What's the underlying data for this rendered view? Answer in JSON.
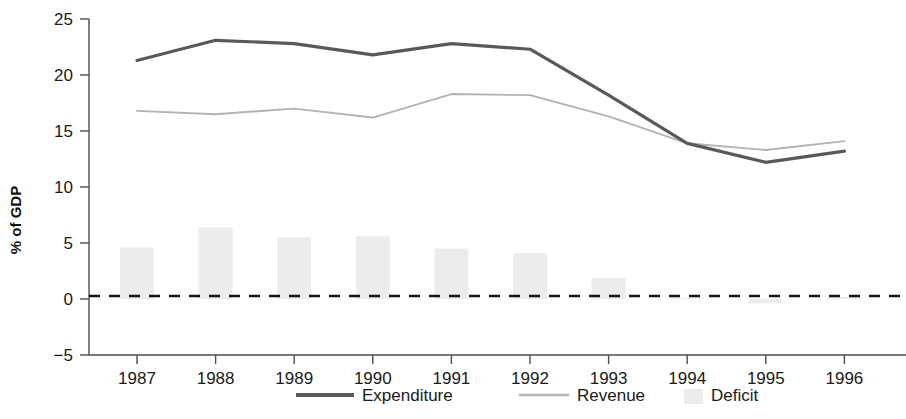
{
  "chart_data": {
    "type": "line",
    "title": "",
    "subtitle": "",
    "xlabel": "",
    "ylabel": "% of GDP",
    "categories": [
      "1987",
      "1988",
      "1989",
      "1990",
      "1991",
      "1992",
      "1993",
      "1994",
      "1995",
      "1996"
    ],
    "x": [
      1987,
      1988,
      1989,
      1990,
      1991,
      1992,
      1993,
      1994,
      1995,
      1996
    ],
    "ylim": [
      -5,
      25
    ],
    "yticks": [
      25,
      20,
      15,
      10,
      5,
      0,
      -5
    ],
    "ytick_labels": [
      "25",
      "20",
      "15",
      "10",
      "5",
      "0",
      "−5"
    ],
    "grid": false,
    "legend_position": "bottom",
    "zero_reference_line": 0,
    "series": [
      {
        "name": "Expenditure",
        "type": "line",
        "color": "#595959",
        "values": [
          21.3,
          23.1,
          22.8,
          21.8,
          22.8,
          22.3,
          18.2,
          13.9,
          12.2,
          13.2
        ]
      },
      {
        "name": "Revenue",
        "type": "line",
        "color": "#b3b3b3",
        "values": [
          16.8,
          16.5,
          17.0,
          16.2,
          18.3,
          18.2,
          16.3,
          13.9,
          13.3,
          14.1
        ]
      },
      {
        "name": "Deficit",
        "type": "bar",
        "color": "#ececec",
        "values": [
          4.6,
          6.4,
          5.5,
          5.6,
          4.5,
          4.1,
          1.9,
          0.1,
          -0.4,
          0.2
        ]
      }
    ]
  },
  "legend": {
    "items": [
      {
        "label": "Expenditure",
        "marker": "thick-line",
        "color": "#595959"
      },
      {
        "label": "Revenue",
        "marker": "thin-line",
        "color": "#b3b3b3"
      },
      {
        "label": "Deficit",
        "marker": "filled-square",
        "color": "#ececec"
      }
    ]
  },
  "axes": {
    "y_axis_title": "% of GDP"
  }
}
